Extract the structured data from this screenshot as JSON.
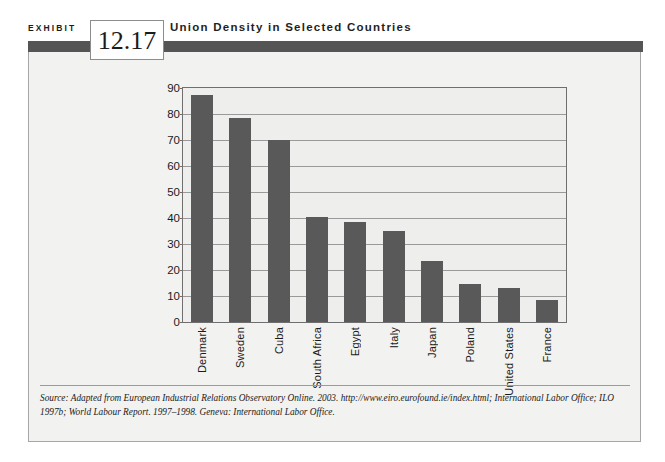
{
  "exhibit": {
    "label": "EXHIBIT",
    "number": "12.17",
    "title": "Union Density in Selected Countries",
    "source": "Source:  Adapted from European Industrial Relations Observatory Online. 2003. http://www.eiro.eurofound.ie/index.html; International Labor Office; ILO 1997b; World Labour Report. 1997–1998. Geneva: International Labor Office."
  },
  "colors": {
    "bar": "#595959",
    "header_rule": "#555555",
    "panel_background": "#f2f2f0",
    "plot_background": "#eeeeec",
    "frame": "#6f6f6f",
    "gridline": "#9a9a9a"
  },
  "chart_data": {
    "type": "bar",
    "title": "Union Density in Selected Countries",
    "xlabel": "",
    "ylabel": "",
    "ylim": [
      0,
      90
    ],
    "ytick_step": 10,
    "yticks": [
      0,
      10,
      20,
      30,
      40,
      50,
      60,
      70,
      80,
      90
    ],
    "grid": true,
    "legend": "none",
    "categories": [
      "Denmark",
      "Sweden",
      "Cuba",
      "South Africa",
      "Egypt",
      "Italy",
      "Japan",
      "Poland",
      "United States",
      "France"
    ],
    "values": [
      87.5,
      78.5,
      70,
      40.5,
      38.5,
      35,
      23.5,
      14.5,
      13,
      8.5
    ]
  }
}
